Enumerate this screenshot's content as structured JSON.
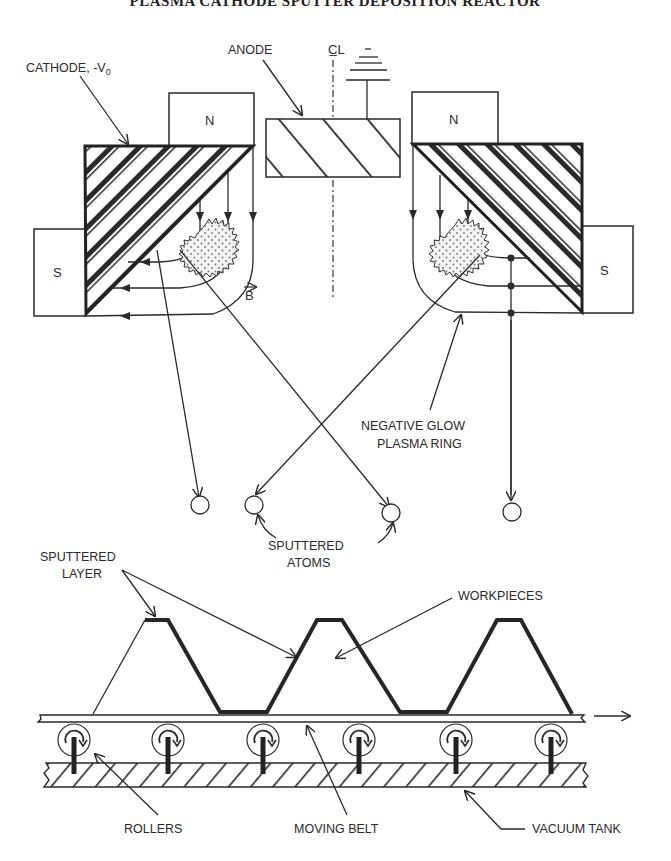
{
  "title": "PLASMA CATHODE SPUTTER DEPOSITION REACTOR",
  "labels": {
    "cathode": "CATHODE, -V",
    "cathode_sub": "0",
    "anode": "ANODE",
    "centerline": "C̲L",
    "magnet_north_left": "N",
    "magnet_north_right": "N",
    "magnet_south_left": "S",
    "magnet_south_right": "S",
    "field": "B",
    "plasma_line1": "NEGATIVE GLOW",
    "plasma_line2": "PLASMA RING",
    "atoms_line1": "SPUTTERED",
    "atoms_line2": "ATOMS",
    "layer_line1": "SPUTTERED",
    "layer_line2": "LAYER",
    "workpieces": "WORKPIECES",
    "rollers": "ROLLERS",
    "belt": "MOVING BELT",
    "tank": "VACUUM TANK"
  },
  "components": {
    "roller_count": 6,
    "sputtered_atom_count": 4,
    "workpiece_count": 3,
    "belt_direction": "right"
  }
}
